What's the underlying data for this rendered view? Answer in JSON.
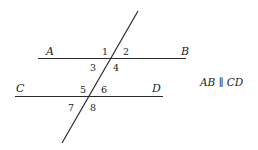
{
  "diagram": {
    "points": {
      "A": "A",
      "B": "B",
      "C": "C",
      "D": "D"
    },
    "angles": [
      "1",
      "2",
      "3",
      "4",
      "5",
      "6",
      "7",
      "8"
    ],
    "note": "AB ∥ CD",
    "colors": {
      "line": "#2a2a2a",
      "text": "#222222",
      "background": "#ffffff"
    }
  }
}
